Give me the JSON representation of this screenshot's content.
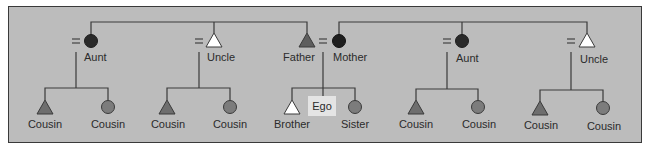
{
  "diagram": {
    "type": "kinship-chart",
    "colors": {
      "background": "#bcbcbc",
      "border": "#3a3a3a",
      "line": "#3a3a3a",
      "dark_female": "#2a2a2a",
      "dark_male": "#5e5e5e",
      "cousin_fill": "#7c7c7c",
      "open_fill": "#ffffff",
      "ego_box": "#e4e4e4"
    },
    "equals_sign": "=",
    "parents_generation": [
      {
        "id": "aunt-left",
        "label": "Aunt",
        "shape": "circle",
        "fill": "dark",
        "spouse": "="
      },
      {
        "id": "uncle-left",
        "label": "Uncle",
        "shape": "triangle",
        "fill": "open",
        "spouse": "="
      },
      {
        "id": "father",
        "label": "Father",
        "shape": "triangle",
        "fill": "dark"
      },
      {
        "id": "mother",
        "label": "Mother",
        "shape": "circle",
        "fill": "dark"
      },
      {
        "id": "aunt-right",
        "label": "Aunt",
        "shape": "circle",
        "fill": "dark",
        "spouse": "="
      },
      {
        "id": "uncle-right",
        "label": "Uncle",
        "shape": "triangle",
        "fill": "open",
        "spouse": "="
      }
    ],
    "children_generation": [
      {
        "label": "Cousin",
        "shape": "triangle",
        "parent": "aunt-left"
      },
      {
        "label": "Cousin",
        "shape": "circle",
        "parent": "aunt-left"
      },
      {
        "label": "Cousin",
        "shape": "triangle",
        "parent": "uncle-left"
      },
      {
        "label": "Cousin",
        "shape": "circle",
        "parent": "uncle-left"
      },
      {
        "label": "Brother",
        "shape": "triangle",
        "fill": "open",
        "parent": "father-mother"
      },
      {
        "label": "Sister",
        "shape": "circle",
        "parent": "father-mother"
      },
      {
        "label": "Cousin",
        "shape": "triangle",
        "parent": "aunt-right"
      },
      {
        "label": "Cousin",
        "shape": "circle",
        "parent": "aunt-right"
      },
      {
        "label": "Cousin",
        "shape": "triangle",
        "parent": "uncle-right"
      },
      {
        "label": "Cousin",
        "shape": "circle",
        "parent": "uncle-right"
      }
    ],
    "ego_label": "Ego"
  }
}
